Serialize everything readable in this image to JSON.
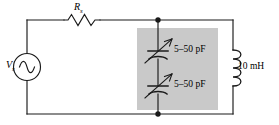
{
  "figure": {
    "kind": "schematic-diagram",
    "background_color": "#ffffff",
    "wire_color": "#1a1a1a",
    "shade_color": "#c9c9c9"
  },
  "components": {
    "source": {
      "name": "ac-voltage-source",
      "label": "V",
      "subscript": "s",
      "symbol": "sine-wave-in-circle"
    },
    "resistor": {
      "name": "series-resistor",
      "label": "R",
      "subscript": "s",
      "symbol": "zigzag"
    },
    "capacitor_top": {
      "name": "variable-capacitor-top",
      "label": "5–50 pF",
      "symbol": "variable-capacitor"
    },
    "capacitor_bottom": {
      "name": "variable-capacitor-bottom",
      "label": "5–50 pF",
      "symbol": "variable-capacitor"
    },
    "inductor": {
      "name": "inductor",
      "label": "10 mH",
      "symbol": "coil"
    }
  },
  "nodes": {
    "top_junction": "junction-dot",
    "bottom_junction": "junction-dot"
  },
  "shaded_region": {
    "name": "tuning-capacitor-block",
    "color": "#c9c9c9"
  }
}
